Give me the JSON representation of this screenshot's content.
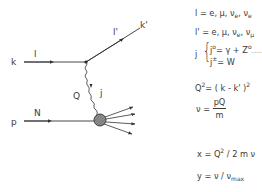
{
  "diagram": {
    "labels": {
      "incoming_lepton_momentum": "k",
      "incoming_lepton": "l",
      "outgoing_lepton_momentum": "k'",
      "outgoing_lepton": "l'",
      "momentum_transfer": "Q",
      "current": "j",
      "nucleon_momentum": "p",
      "nucleon": "N"
    },
    "colors": {
      "line": "#333333",
      "blob": "#777777"
    }
  },
  "equations": {
    "l_def": {
      "lhs": "l = e, μ, ν",
      "sub1": "e",
      "mid": ", ν",
      "sub2": "e"
    },
    "lp_def": {
      "lhs": "l' = e, μ, ν",
      "sub1": "e",
      "mid": ", ν",
      "sub2": "μ"
    },
    "j_def": {
      "j": "j",
      "brace": "{",
      "line1_j": "j",
      "line1_sup": "o",
      "line1_rhs": "= γ + Z",
      "line1_rhs_sup": "o",
      "line1_dots": ".........",
      "line2_j": "j",
      "line2_sup": "±",
      "line2_rhs": "= W"
    },
    "q2_def": {
      "lhs": "Q",
      "sup": "2",
      "rhs": "= ( k - k' )",
      "rhs_sup": "2"
    },
    "nu_def": {
      "lhs": "ν =",
      "num": "pQ",
      "den": "m"
    },
    "x_def": {
      "lhs": "x = Q",
      "sup": "2",
      "rhs": " / 2 m ν"
    },
    "y_def": {
      "lhs": "y = ν / ν",
      "sub": "max"
    }
  }
}
